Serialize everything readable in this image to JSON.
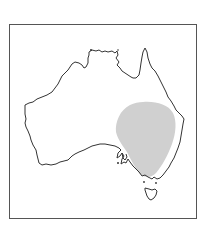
{
  "map": {
    "subject": "Australia species distribution range map",
    "region": "Australia",
    "highlighted_area": "South-eastern Australia (inland NSW, Victoria, eastern South Australia, southern Queensland)",
    "colors": {
      "coastline": "#333333",
      "range_fill": "#d0d0d0",
      "frame": "#555555",
      "background": "#ffffff"
    }
  }
}
